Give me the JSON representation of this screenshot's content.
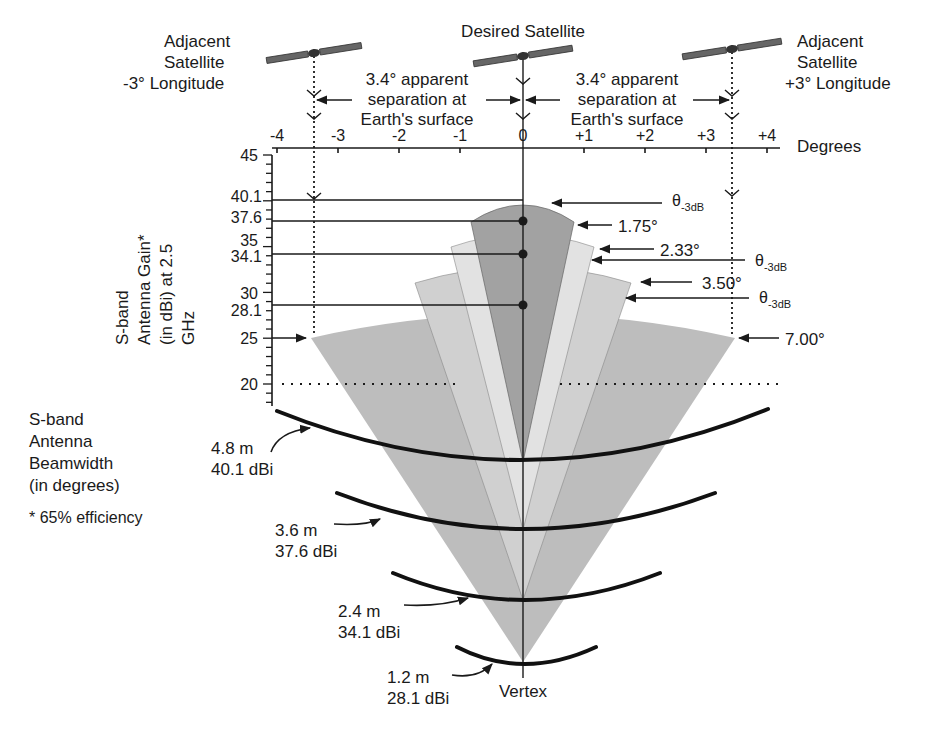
{
  "diagram": {
    "satellites": {
      "left": {
        "line1": "Adjacent",
        "line2": "Satellite",
        "line3": "-3° Longitude"
      },
      "center": {
        "label": "Desired Satellite"
      },
      "right": {
        "line1": "Adjacent",
        "line2": "Satellite",
        "line3": "+3° Longitude"
      }
    },
    "separation_left": {
      "line1": "3.4° apparent",
      "line2": "separation at",
      "line3": "Earth's surface"
    },
    "separation_right": {
      "line1": "3.4° apparent",
      "line2": "separation at",
      "line3": "Earth's surface"
    },
    "x_axis": {
      "label": "Degrees",
      "ticks": [
        "-4",
        "-3",
        "-2",
        "-1",
        "0",
        "+1",
        "+2",
        "+3",
        "+4"
      ]
    },
    "y_axis": {
      "label_line1": "S-band",
      "label_line2": "Antenna Gain*",
      "label_line3": "(in dBi) at 2.5",
      "label_line4": "GHz",
      "ticks": [
        "45",
        "40.1",
        "37.6",
        "35",
        "34.1",
        "30",
        "28.1",
        "25",
        "20"
      ]
    },
    "beam_labels": {
      "theta": "θ",
      "theta_sub": "-3dB",
      "b1": "1.75°",
      "b2": "2.33°",
      "b3": "3.50°",
      "b4": "7.00°"
    },
    "legend": {
      "line1": "S-band",
      "line2": "Antenna",
      "line3": "Beamwidth",
      "line4": "(in degrees)",
      "footnote": "* 65% efficiency"
    },
    "antennas": [
      {
        "size": "4.8 m",
        "gain": "40.1 dBi"
      },
      {
        "size": "3.6 m",
        "gain": "37.6 dBi"
      },
      {
        "size": "2.4 m",
        "gain": "34.1 dBi"
      },
      {
        "size": "1.2 m",
        "gain": "28.1 dBi"
      }
    ],
    "vertex_label": "Vertex",
    "colors": {
      "beam_1_75": "#9a9a9a",
      "beam_2_33": "#dcdcdc",
      "beam_3_50": "#c8c8c8",
      "beam_7_00": "#bdbdbd",
      "ink": "#1a1a1a"
    }
  }
}
